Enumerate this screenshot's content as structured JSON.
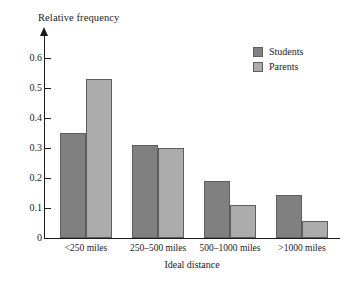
{
  "chart_data": {
    "type": "bar",
    "title": "",
    "xlabel": "Ideal distance",
    "ylabel": "Relative frequency",
    "categories": [
      "<250 miles",
      "250–500 miles",
      "500–1000 miles",
      ">1000 miles"
    ],
    "series": [
      {
        "name": "Students",
        "color": "#808080",
        "values": [
          0.35,
          0.31,
          0.19,
          0.145
        ]
      },
      {
        "name": "Parents",
        "color": "#acacac",
        "values": [
          0.53,
          0.3,
          0.11,
          0.057
        ]
      }
    ],
    "ylim": [
      0,
      0.64
    ],
    "yticks": [
      0,
      0.1,
      0.2,
      0.3,
      0.4,
      0.5,
      0.6
    ],
    "ytick_labels": [
      "0",
      "0.1",
      "0.2",
      "0.3",
      "0.4",
      "0.5",
      "0.6"
    ],
    "grid": false,
    "legend_position": "top-right",
    "legend": [
      "Students",
      "Parents"
    ],
    "axis_color": "#1a1a1a",
    "bar_edge_color": "#5e5e5e",
    "background": "#ffffff"
  }
}
